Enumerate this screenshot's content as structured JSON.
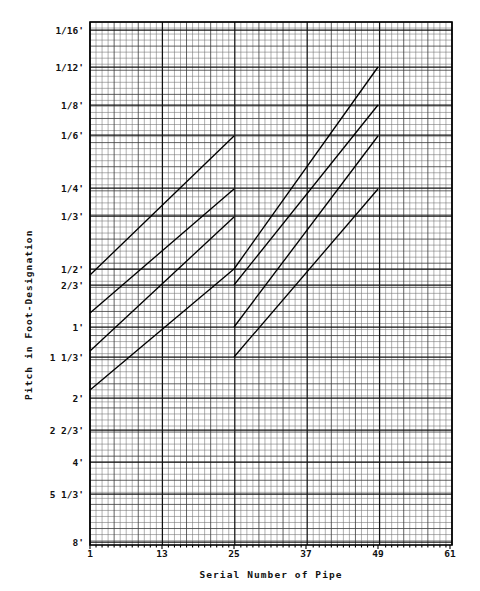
{
  "figure": {
    "kind": "engineering-graph",
    "background": "#ffffff",
    "ink_color": "#000000"
  },
  "axes": {
    "y_title": "Pitch in Foot-Designation",
    "x_title": "Serial Number of Pipe",
    "y_tick_labels": [
      "1/16'",
      "1/12'",
      "1/8'",
      "1/6'",
      "1/4'",
      "1/3'",
      "1/2'",
      "2/3'",
      "1'",
      "1 1/3'",
      "2'",
      "2 2/3'",
      "4'",
      "5 1/3'",
      "8'"
    ],
    "x_tick_labels": [
      "1",
      "13",
      "25",
      "37",
      "49",
      "61"
    ]
  },
  "chart_data": {
    "type": "line",
    "title": "",
    "subtitle": "",
    "xlabel": "Serial Number of Pipe",
    "ylabel": "Pitch in Foot-Designation",
    "xlim": [
      1,
      61
    ],
    "ylim_labels_top_to_bottom": [
      "1/16'",
      "8'"
    ],
    "x_ticks": [
      1,
      13,
      25,
      37,
      49,
      61
    ],
    "x_tick_labels": [
      "1",
      "13",
      "25",
      "37",
      "49",
      "61"
    ],
    "y_ticks_feet": [
      0.0625,
      0.08333,
      0.125,
      0.16667,
      0.25,
      0.33333,
      0.5,
      0.66667,
      1,
      1.33333,
      2,
      2.66667,
      4,
      5.33333,
      8
    ],
    "y_tick_labels": [
      "1/16'",
      "1/12'",
      "1/8'",
      "1/6'",
      "1/4'",
      "1/3'",
      "1/2'",
      "2/3'",
      "1'",
      "1 1/3'",
      "2'",
      "2 2/3'",
      "4'",
      "5 1/3'",
      "8'"
    ],
    "y_scale": "logarithmic-inverted",
    "grid": true,
    "grid_style": "fine engineering graph paper, minor cells with heavier every 4th and major ruled lines at labeled ticks",
    "legend": "none",
    "legend_position": "none",
    "annotations": [],
    "series": [
      {
        "name": "Rank 1 segment A",
        "group": 1,
        "points": [
          {
            "x": 1,
            "y_label": "2/3'"
          },
          {
            "x": 25,
            "y_label": "1/6'"
          }
        ]
      },
      {
        "name": "Rank 2 segment A",
        "group": 1,
        "points": [
          {
            "x": 1,
            "y_label": "1'"
          },
          {
            "x": 25,
            "y_label": "1/4'"
          }
        ]
      },
      {
        "name": "Rank 3 segment A",
        "group": 1,
        "points": [
          {
            "x": 1,
            "y_label": "1 1/3'"
          },
          {
            "x": 25,
            "y_label": "1/3'"
          }
        ]
      },
      {
        "name": "Rank 4 segment A",
        "group": 1,
        "points": [
          {
            "x": 1,
            "y_label": "2'"
          },
          {
            "x": 25,
            "y_label": "1/2'"
          }
        ]
      },
      {
        "name": "Rank 1 segment B",
        "group": 2,
        "points": [
          {
            "x": 25,
            "y_label": "1/2'"
          },
          {
            "x": 49,
            "y_label": "1/12'"
          }
        ]
      },
      {
        "name": "Rank 2 segment B",
        "group": 2,
        "points": [
          {
            "x": 25,
            "y_label": "2/3'"
          },
          {
            "x": 49,
            "y_label": "1/8'"
          }
        ]
      },
      {
        "name": "Rank 3 segment B",
        "group": 2,
        "points": [
          {
            "x": 25,
            "y_label": "1'"
          },
          {
            "x": 49,
            "y_label": "1/6'"
          }
        ]
      },
      {
        "name": "Rank 4 segment B",
        "group": 2,
        "points": [
          {
            "x": 25,
            "y_label": "1 1/3'"
          },
          {
            "x": 49,
            "y_label": "1/4'"
          }
        ]
      }
    ]
  },
  "geometry": {
    "plot_left": 90,
    "plot_right": 452,
    "plot_top": 22,
    "plot_bottom": 545,
    "minor_step_x": 6.033,
    "minor_step_y": 6.03,
    "note": "x major every 12 minor cells; y ruled lines at each labeled pitch"
  },
  "y_axis_rows": [
    {
      "label": "1/16'",
      "y": 30
    },
    {
      "label": "1/12'",
      "y": 67
    },
    {
      "label": "1/8'",
      "y": 105
    },
    {
      "label": "1/6'",
      "y": 135
    },
    {
      "label": "1/4'",
      "y": 188
    },
    {
      "label": "1/3'",
      "y": 216
    },
    {
      "label": "1/2'",
      "y": 269
    },
    {
      "label": "2/3'",
      "y": 285
    },
    {
      "label": "1'",
      "y": 327
    },
    {
      "label": "1 1/3'",
      "y": 357
    },
    {
      "label": "2'",
      "y": 398
    },
    {
      "label": "2 2/3'",
      "y": 430
    },
    {
      "label": "4'",
      "y": 462
    },
    {
      "label": "5 1/3'",
      "y": 494
    },
    {
      "label": "8'",
      "y": 542
    }
  ],
  "x_axis_cols": [
    {
      "label": "1",
      "x": 90
    },
    {
      "label": "13",
      "x": 162
    },
    {
      "label": "25",
      "x": 234
    },
    {
      "label": "37",
      "x": 306
    },
    {
      "label": "49",
      "x": 378
    },
    {
      "label": "61",
      "x": 450
    }
  ],
  "lines_px": [
    {
      "x1": 90,
      "y1": 275,
      "x2": 234,
      "y2": 136
    },
    {
      "x1": 90,
      "y1": 313,
      "x2": 234,
      "y2": 189
    },
    {
      "x1": 90,
      "y1": 351,
      "x2": 234,
      "y2": 217
    },
    {
      "x1": 90,
      "y1": 390,
      "x2": 234,
      "y2": 269
    },
    {
      "x1": 234,
      "y1": 269,
      "x2": 378,
      "y2": 67
    },
    {
      "x1": 234,
      "y1": 285,
      "x2": 378,
      "y2": 105
    },
    {
      "x1": 234,
      "y1": 327,
      "x2": 378,
      "y2": 136
    },
    {
      "x1": 234,
      "y1": 357,
      "x2": 378,
      "y2": 189
    }
  ]
}
